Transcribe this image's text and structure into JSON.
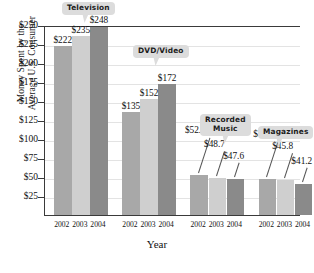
{
  "chart_data": {
    "type": "bar",
    "title": "",
    "xlabel": "Year",
    "ylabel": "Money Spent by the Average U.S. Consumer",
    "ylabel_lines": [
      "Money Spent by the",
      "Average U.S. Consumer"
    ],
    "ylim": [
      0,
      250
    ],
    "ytick_labels": [
      "$25",
      "$50",
      "$75",
      "$100",
      "$125",
      "$150",
      "$175",
      "$200",
      "$225",
      "$250"
    ],
    "ytick_values": [
      25,
      50,
      75,
      100,
      125,
      150,
      175,
      200,
      225,
      250
    ],
    "grid": true,
    "legend": "none",
    "categories": [
      "2002",
      "2003",
      "2004"
    ],
    "groups": [
      {
        "name": "Television",
        "values": [
          222,
          235,
          248
        ],
        "value_labels": [
          "$222",
          "$235",
          "$248"
        ],
        "xticks": [
          "2002",
          "2003",
          "2004"
        ]
      },
      {
        "name": "DVD/Video",
        "values": [
          135,
          152,
          172
        ],
        "value_labels": [
          "$135",
          "$152",
          "$172"
        ],
        "xticks": [
          "2002",
          "2003",
          "2004"
        ]
      },
      {
        "name": "Recorded Music",
        "name_lines": [
          "Recorded",
          "Music"
        ],
        "values": [
          52.4,
          48.7,
          47.6
        ],
        "value_labels": [
          "$52.4",
          "$48.7",
          "$47.6"
        ],
        "xticks": [
          "2002",
          "2003",
          "2004"
        ]
      },
      {
        "name": "Magazines",
        "values": [
          46.8,
          45.8,
          41.2
        ],
        "value_labels": [
          "$46.8",
          "$45.8",
          "$41.2"
        ],
        "xticks": [
          "2002",
          "2003",
          "2004"
        ]
      }
    ],
    "series_colors": {
      "2002": "#a8a8a8",
      "2003": "#cfcfcf",
      "2004": "#8a8a8a"
    },
    "callout_color": "#dcdcdc"
  },
  "axis": {
    "y_title_line1": "Money Spent by the",
    "y_title_line2": "Average U.S. Consumer",
    "x_title": "Year"
  },
  "caption": {
    "text": ""
  }
}
